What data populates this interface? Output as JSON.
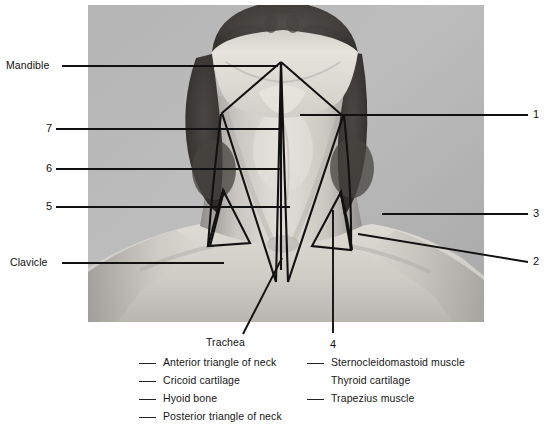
{
  "figure": {
    "type": "anatomy-photo-worksheet",
    "photo": {
      "x": 88,
      "y": 5,
      "width": 396,
      "height": 317,
      "tone": "grayscale",
      "background_hex": "#b8b8b8"
    },
    "overlay_color": "#111111"
  },
  "callouts": {
    "left": [
      {
        "id": "mandible",
        "text": "Mandible",
        "text_x": 6,
        "text_y": 61,
        "line_from_x": 62,
        "line_to_x": 278,
        "line_y": 66
      },
      {
        "id": "seven",
        "text": "7",
        "text_x": 47,
        "text_y": 124,
        "line_from_x": 56,
        "line_to_x": 282,
        "line_y": 129
      },
      {
        "id": "six",
        "text": "6",
        "text_x": 47,
        "text_y": 164,
        "line_from_x": 56,
        "line_to_x": 282,
        "line_y": 169
      },
      {
        "id": "five",
        "text": "5",
        "text_x": 47,
        "text_y": 202,
        "line_from_x": 56,
        "line_to_x": 290,
        "line_y": 207
      },
      {
        "id": "clavicle",
        "text": "Clavicle",
        "text_x": 10,
        "text_y": 258,
        "line_from_x": 62,
        "line_to_x": 224,
        "line_y": 263
      }
    ],
    "right": [
      {
        "id": "one",
        "text": "1",
        "text_x": 534,
        "text_y": 110,
        "line_from_x": 300,
        "line_to_x": 528,
        "line_y": 115
      },
      {
        "id": "three",
        "text": "3",
        "text_x": 534,
        "text_y": 209,
        "line_from_x": 382,
        "line_to_x": 528,
        "line_y": 214
      },
      {
        "id": "two",
        "text": "2",
        "text_x": 534,
        "text_y": 257,
        "line_from_x": 358,
        "line_from_y": 234,
        "line_to_x": 528,
        "line_to_y": 262
      }
    ],
    "bottom": [
      {
        "id": "trachea",
        "text": "Trachea",
        "text_x": 206,
        "text_y": 338,
        "line_from_x": 243,
        "line_from_y": 334,
        "line_to_x": 282,
        "line_to_y": 258
      },
      {
        "id": "four",
        "text": "4",
        "text_x": 330,
        "text_y": 340,
        "line_x": 333,
        "line_from_y": 210,
        "line_to_y": 333
      }
    ]
  },
  "answer_key": {
    "left_column": [
      {
        "label": "Anterior triangle of neck",
        "has_blank": true
      },
      {
        "label": "Cricoid cartilage",
        "has_blank": true
      },
      {
        "label": "Hyoid bone",
        "has_blank": true
      },
      {
        "label": "Posterior triangle of neck",
        "has_blank": true
      }
    ],
    "right_column": [
      {
        "label": "Sternocleidomastoid muscle",
        "has_blank": true
      },
      {
        "label": "Thyroid cartilage",
        "has_blank": false
      },
      {
        "label": "Trapezius muscle",
        "has_blank": true
      }
    ]
  }
}
